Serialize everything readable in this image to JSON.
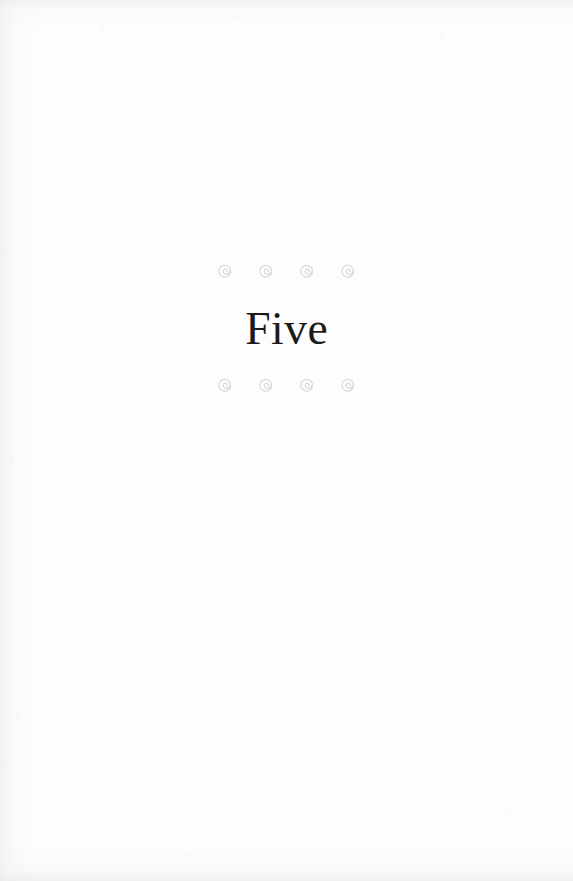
{
  "page": {
    "kind": "book-chapter-opening-page",
    "background_color": "#fefefe",
    "width": 573,
    "height": 881
  },
  "chapter": {
    "title": "Five",
    "title_color": "#1a1a1a"
  },
  "ornaments": {
    "glyph_name": "spiral-ornament",
    "color": "#d8dadc",
    "count_per_row": 4,
    "rows": [
      {
        "position": "above-title",
        "items": [
          "spiral-ornament",
          "spiral-ornament",
          "spiral-ornament",
          "spiral-ornament"
        ]
      },
      {
        "position": "below-title",
        "items": [
          "spiral-ornament",
          "spiral-ornament",
          "spiral-ornament",
          "spiral-ornament"
        ]
      }
    ]
  }
}
